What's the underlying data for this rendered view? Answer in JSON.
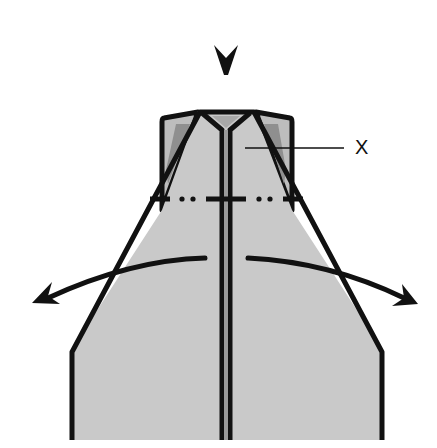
{
  "diagram": {
    "type": "origami-fold-step",
    "label": "X",
    "colors": {
      "paper": "#c9c9c9",
      "paper_shadow": "#8f8f8f",
      "outline": "#111111",
      "inner_triangle": "#b5b5b5",
      "background": "#ffffff"
    },
    "elements": {
      "push_arrow": "down arrowhead above model",
      "fold_line": "dash-dot mountain/valley line across model",
      "open_arrows": [
        "curved arrow pointing left",
        "curved arrow pointing right"
      ],
      "center_crease": "double vertical line"
    }
  }
}
